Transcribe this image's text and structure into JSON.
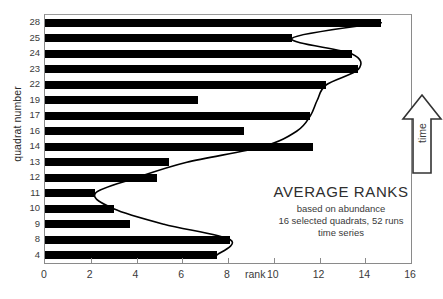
{
  "chart_data": {
    "type": "bar",
    "orientation": "horizontal",
    "title": "AVERAGE RANKS",
    "subtitle_lines": [
      "based on abundance",
      "16 selected quadrats,  52 runs",
      "time series"
    ],
    "xlabel": "rank",
    "ylabel": "quadrat number",
    "xlim": [
      0,
      16
    ],
    "xticks": [
      0,
      2,
      4,
      6,
      8,
      10,
      12,
      14,
      16
    ],
    "xtick_labels": [
      "0",
      "2",
      "4",
      "6",
      "8",
      "10",
      "12",
      "14",
      "16"
    ],
    "grid": false,
    "legend": null,
    "categories": [
      "28",
      "25",
      "24",
      "23",
      "22",
      "19",
      "17",
      "16",
      "14",
      "13",
      "12",
      "11",
      "10",
      "9",
      "8",
      "4"
    ],
    "values": [
      14.7,
      10.8,
      13.4,
      13.7,
      12.3,
      6.7,
      11.6,
      8.7,
      11.7,
      5.4,
      4.9,
      2.2,
      3.0,
      3.7,
      8.1,
      7.5
    ],
    "bar_color": "#000000",
    "overlay_curve": {
      "name": "trend curve through bar ends",
      "color": "#000000",
      "points": [
        {
          "rank": 14.7,
          "quadrat": "28"
        },
        {
          "rank": 10.8,
          "quadrat": "25"
        },
        {
          "rank": 13.4,
          "quadrat": "24"
        },
        {
          "rank": 13.7,
          "quadrat": "23"
        },
        {
          "rank": 12.3,
          "quadrat": "22"
        },
        {
          "rank": 11.9,
          "quadrat": "19"
        },
        {
          "rank": 11.6,
          "quadrat": "17"
        },
        {
          "rank": 11.0,
          "quadrat": "16"
        },
        {
          "rank": 9.5,
          "quadrat": "14"
        },
        {
          "rank": 6.2,
          "quadrat": "13"
        },
        {
          "rank": 4.0,
          "quadrat": "12"
        },
        {
          "rank": 2.2,
          "quadrat": "11"
        },
        {
          "rank": 3.0,
          "quadrat": "10"
        },
        {
          "rank": 5.2,
          "quadrat": "9"
        },
        {
          "rank": 8.1,
          "quadrat": "8"
        },
        {
          "rank": 7.5,
          "quadrat": "4"
        }
      ]
    },
    "annotations": [
      {
        "name": "time-arrow",
        "label": "time",
        "direction": "up"
      }
    ]
  },
  "axis": {
    "y_title": "quadrat number",
    "x_title": "rank"
  },
  "time_arrow": {
    "label": "time"
  }
}
